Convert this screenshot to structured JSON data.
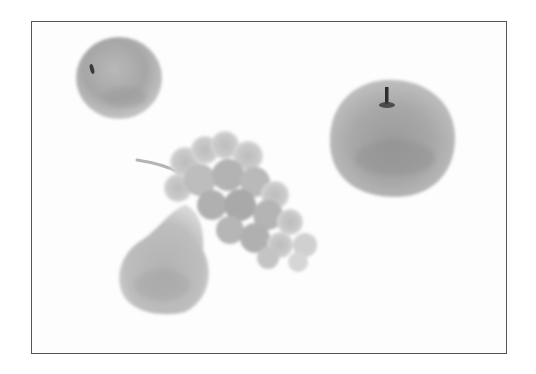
{
  "image": {
    "description": "Grayscale still life of fruit inside a thin rectangular border",
    "colors": {
      "background": "#ffffff",
      "border": "#555555",
      "fruit_dark": "#8a8a8a",
      "fruit_mid": "#a9a9a9",
      "fruit_light": "#cfcfcf",
      "stem": "#2e2e2e"
    },
    "objects": [
      {
        "name": "small-apple",
        "label": "Small apple (top-left)"
      },
      {
        "name": "large-apple",
        "label": "Large apple with stem (right)"
      },
      {
        "name": "grape-bunch",
        "label": "Bunch of grapes (center)"
      },
      {
        "name": "pear",
        "label": "Pear (bottom-left)"
      }
    ]
  }
}
